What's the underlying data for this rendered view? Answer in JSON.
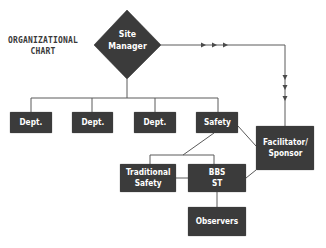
{
  "title": "ORGANIZATIONAL\nCHART",
  "nodes": {
    "site_manager": "Site\nManager",
    "dept1": "Dept.",
    "dept2": "Dept.",
    "dept3": "Dept.",
    "safety": "Safety",
    "facilitator": "Facilitator/\nSponsor",
    "traditional_safety": "Traditional\nSafety",
    "bbs_st": "BBS\nST",
    "observers": "Observers"
  },
  "colors": {
    "node_fill": "#3b3b3b",
    "node_text": "#ffffff",
    "line": "#555555",
    "title_text": "#3a3a3a"
  }
}
